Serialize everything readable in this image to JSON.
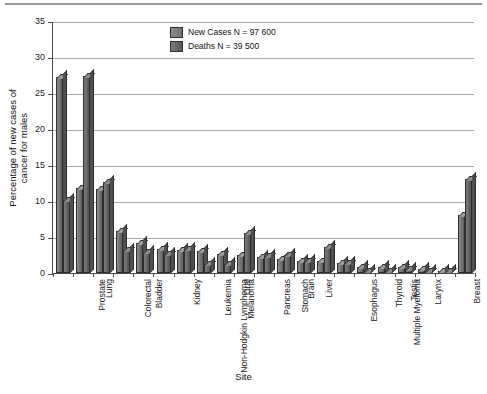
{
  "chart_data": {
    "type": "bar",
    "title": "",
    "xlabel": "Site",
    "ylabel": "Percentage of new cases of cancer for males",
    "ylabel_line1": "Percentage of new cases of",
    "ylabel_line2": "cancer for males",
    "ylim": [
      0,
      35
    ],
    "ytick_step": 5,
    "yticks": [
      0,
      5,
      10,
      15,
      20,
      25,
      30,
      35
    ],
    "grid": true,
    "legend_position": "top-center",
    "categories": [
      "Prostate",
      "Lung",
      "Colorectal",
      "Bladder",
      "Non-Hodgkin Lymphoma",
      "Kidney",
      "Leukemia",
      "Melanoma",
      "Oral",
      "Pancreas",
      "Stomach",
      "Brain",
      "Liver",
      "Esophagus",
      "Multiple Myeloma",
      "Thyroid",
      "Testis",
      "Larynx",
      "Hodgkin Lymphoma",
      "Breast",
      "All other Cancers"
    ],
    "series": [
      {
        "name": "New Cases N = 97 600",
        "short_name": "New Cases",
        "color": "#777777",
        "values": [
          27.2,
          11.8,
          11.7,
          5.9,
          4.2,
          3.4,
          3.2,
          3.1,
          2.6,
          2.5,
          2.2,
          1.9,
          1.6,
          1.6,
          1.4,
          0.9,
          0.8,
          0.8,
          0.5,
          0.2,
          8.0
        ]
      },
      {
        "name": "Deaths N = 39 500",
        "short_name": "Deaths",
        "color": "#5e5e5e",
        "values": [
          10.2,
          27.3,
          12.7,
          3.2,
          2.9,
          2.7,
          3.4,
          1.2,
          1.3,
          5.5,
          2.3,
          2.5,
          1.7,
          3.6,
          1.4,
          0.3,
          0.2,
          0.6,
          0.2,
          0.1,
          13.0
        ]
      }
    ]
  },
  "legend": {
    "items": [
      {
        "label": "New Cases N = 97 600"
      },
      {
        "label": "Deaths N = 39 500"
      }
    ]
  },
  "axes": {
    "x_title": "Site",
    "y_title_line1": "Percentage of new cases of",
    "y_title_line2": "cancer for males"
  }
}
